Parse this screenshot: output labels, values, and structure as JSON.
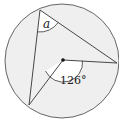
{
  "diagram": {
    "type": "circle-geometry",
    "circle": {
      "cx": 62,
      "cy": 61,
      "r": 57,
      "fill": "#efefef",
      "stroke": "#555555"
    },
    "center_point": {
      "x": 63,
      "y": 60
    },
    "points": {
      "A": {
        "x": 40,
        "y": 10
      },
      "B": {
        "x": 117,
        "y": 63
      },
      "C": {
        "x": 29,
        "y": 105
      }
    },
    "labels": {
      "inscribed_angle": "a",
      "central_angle": "126°"
    }
  }
}
